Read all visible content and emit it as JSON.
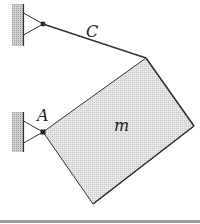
{
  "diagram": {
    "type": "mechanics-free-body",
    "labels": {
      "cable": "C",
      "pin": "A",
      "mass": "m"
    },
    "colors": {
      "line": "#333333",
      "plate_fill": "#dcdcdc",
      "wall_fill": "#bdbdbd",
      "bottom_rule": "#9a9a9a"
    },
    "elements": [
      {
        "id": "upper-wall-support",
        "kind": "wall-with-bracket"
      },
      {
        "id": "cable-C",
        "kind": "cable",
        "from": "upper pin",
        "to": "plate top corner"
      },
      {
        "id": "lower-wall-support",
        "kind": "wall-with-bracket"
      },
      {
        "id": "pin-A",
        "kind": "pin"
      },
      {
        "id": "plate-m",
        "kind": "rectangular-plate"
      }
    ]
  }
}
